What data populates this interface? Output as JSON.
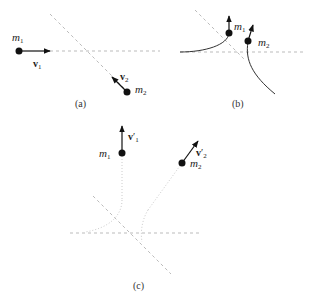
{
  "panels": {
    "a": {
      "caption": "(a)",
      "m1": {
        "name": "m",
        "sub": "1"
      },
      "m2": {
        "name": "m",
        "sub": "2"
      },
      "v1": {
        "name": "v",
        "sub": "1"
      },
      "v2": {
        "name": "v",
        "sub": "2"
      }
    },
    "b": {
      "caption": "(b)",
      "m1": {
        "name": "m",
        "sub": "1"
      },
      "m2": {
        "name": "m",
        "sub": "2"
      }
    },
    "c": {
      "caption": "(c)",
      "m1": {
        "name": "m",
        "sub": "1"
      },
      "m2": {
        "name": "m",
        "sub": "2"
      },
      "v1": {
        "name": "v",
        "prime": "′",
        "sub": "1"
      },
      "v2": {
        "name": "v",
        "prime": "′",
        "sub": "2"
      }
    }
  },
  "colors": {
    "ink": "#111111",
    "dashed": "#bbbbbb",
    "dotted": "#cccccc"
  }
}
